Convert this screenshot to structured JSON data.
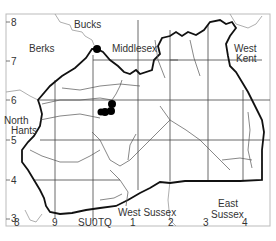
{
  "map": {
    "regions": [
      {
        "name": "Bucks",
        "x": 84,
        "y": 28
      },
      {
        "name": "Berks",
        "x": 29,
        "y": 52
      },
      {
        "name": "Middlesex",
        "x": 112,
        "y": 52
      },
      {
        "name": "West",
        "x": 233,
        "y": 49
      },
      {
        "name": "Kent",
        "x": 235,
        "y": 60
      },
      {
        "name": "North",
        "x": 4,
        "y": 121
      },
      {
        "name": "Hants",
        "x": 11,
        "y": 131
      },
      {
        "name": "East",
        "x": 219,
        "y": 211
      },
      {
        "name": "Sussex",
        "x": 212,
        "y": 222
      },
      {
        "name": "West Sussex",
        "x": 119,
        "y": 216
      },
      {
        "name": "Sussex",
        "x": 14,
        "y": 216
      }
    ],
    "y_ticks": [
      {
        "label": "8",
        "y": 22
      },
      {
        "label": "7",
        "y": 61
      },
      {
        "label": "6",
        "y": 100
      },
      {
        "label": "5",
        "y": 140
      },
      {
        "label": "4",
        "y": 180
      },
      {
        "label": "3",
        "y": 219
      }
    ],
    "x_ticks": [
      {
        "label": "8",
        "x": 16
      },
      {
        "label": "9",
        "x": 55
      },
      {
        "label": "SU",
        "x": 80
      },
      {
        "label": "0",
        "x": 95
      },
      {
        "label": "TQ",
        "x": 99
      },
      {
        "label": "1",
        "x": 133
      },
      {
        "label": "2",
        "x": 172
      },
      {
        "label": "3",
        "x": 206
      },
      {
        "label": "4",
        "x": 245
      }
    ],
    "records": [
      {
        "x": 97,
        "y": 49
      },
      {
        "x": 112,
        "y": 104
      },
      {
        "x": 111,
        "y": 111
      },
      {
        "x": 105,
        "y": 112
      },
      {
        "x": 112,
        "y": 113
      }
    ]
  }
}
